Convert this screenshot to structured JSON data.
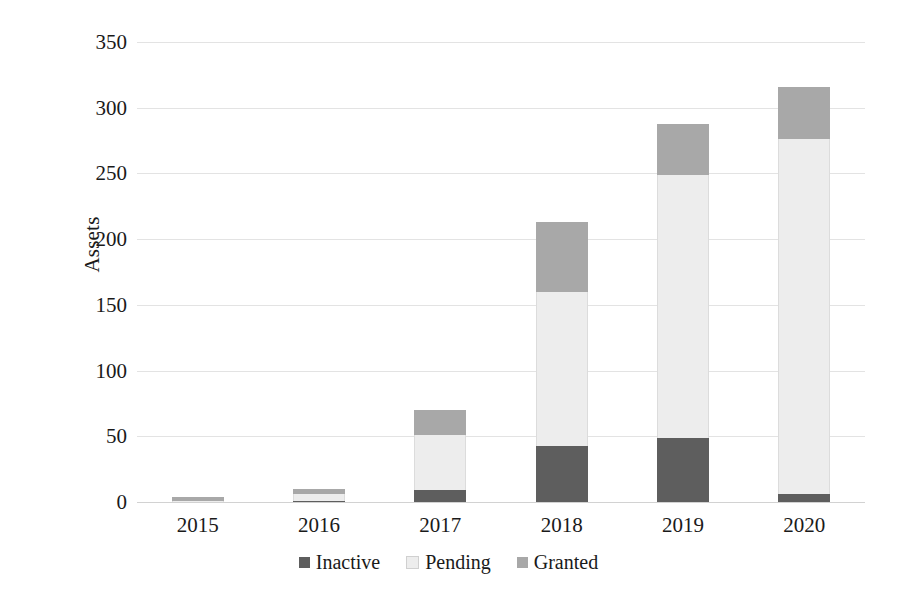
{
  "chart_data": {
    "type": "bar",
    "subtype": "stacked-vertical-bar",
    "title": "",
    "subtitle": "",
    "xlabel": "",
    "ylabel": "Assets",
    "categories": [
      "2015",
      "2016",
      "2017",
      "2018",
      "2019",
      "2020"
    ],
    "series": [
      {
        "name": "Inactive",
        "color": "#5e5e5e",
        "values": [
          0,
          1,
          9,
          43,
          49,
          6
        ]
      },
      {
        "name": "Pending",
        "color": "#ededed",
        "values": [
          1,
          5,
          42,
          117,
          200,
          270
        ]
      },
      {
        "name": "Granted",
        "color": "#a8a8a8",
        "values": [
          3,
          4,
          19,
          53,
          39,
          40
        ]
      }
    ],
    "totals": [
      4,
      10,
      70,
      213,
      288,
      316
    ],
    "stack_order_bottom_to_top": [
      "Inactive",
      "Pending",
      "Granted"
    ],
    "ylim": [
      0,
      350
    ],
    "ytick_values": [
      0,
      50,
      100,
      150,
      200,
      250,
      300,
      350
    ],
    "ytick_labels": [
      "0",
      "50",
      "100",
      "150",
      "200",
      "250",
      "300",
      "350"
    ],
    "grid": {
      "horizontal": true,
      "vertical": false
    },
    "legend": {
      "position": "bottom",
      "orientation": "horizontal"
    },
    "axis_line_color": "#d2d2d2",
    "gridline_color": "#e3e3e3",
    "background_color": "#ffffff"
  }
}
